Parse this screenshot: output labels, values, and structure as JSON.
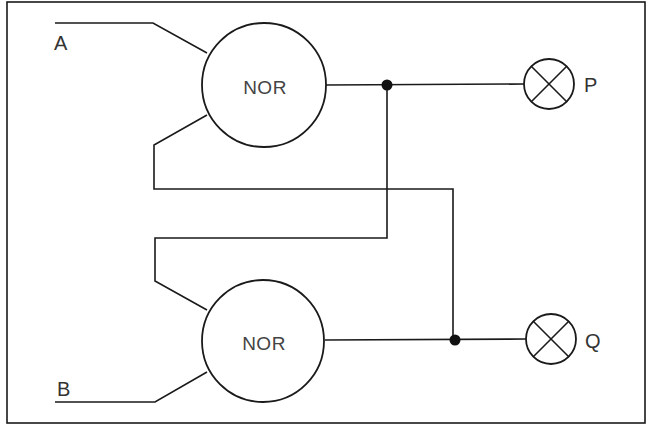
{
  "diagram": {
    "title": "",
    "type": "logic-circuit",
    "colors": {
      "line": "#1a1a1a",
      "text": "#333333",
      "background": "#ffffff"
    },
    "inputs": [
      {
        "id": "A",
        "label": "A"
      },
      {
        "id": "B",
        "label": "B"
      }
    ],
    "gates": [
      {
        "id": "gate-top",
        "label": "NOR"
      },
      {
        "id": "gate-bottom",
        "label": "NOR"
      }
    ],
    "outputs": [
      {
        "id": "P",
        "label": "P",
        "icon": "lamp-icon"
      },
      {
        "id": "Q",
        "label": "Q",
        "icon": "lamp-icon"
      }
    ],
    "connections": [
      {
        "from": "A",
        "to": "gate-top"
      },
      {
        "from": "gate-bottom.output",
        "to": "gate-top"
      },
      {
        "from": "gate-top.output",
        "to": "P"
      },
      {
        "from": "gate-top.output",
        "to": "gate-bottom"
      },
      {
        "from": "B",
        "to": "gate-bottom"
      },
      {
        "from": "gate-bottom.output",
        "to": "Q"
      }
    ]
  }
}
